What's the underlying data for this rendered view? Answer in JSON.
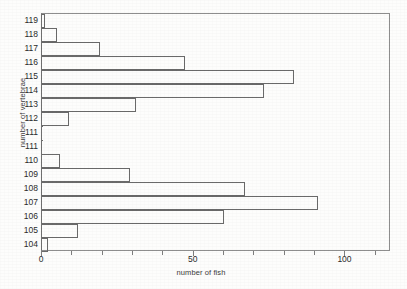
{
  "chart_data": {
    "type": "bar",
    "orientation": "horizontal",
    "title": "",
    "xlabel": "number of fish",
    "ylabel": "number of vertebrae",
    "categories": [
      "119",
      "118",
      "117",
      "116",
      "115",
      "114",
      "113",
      "112",
      "111",
      "111",
      "110",
      "109",
      "108",
      "107",
      "106",
      "105",
      "104"
    ],
    "values": [
      1,
      5,
      19,
      47,
      83,
      73,
      31,
      9,
      0,
      0,
      6,
      29,
      67,
      91,
      60,
      12,
      2
    ],
    "xlim": [
      0,
      115
    ],
    "ylim": [
      0,
      17
    ],
    "xticks": [
      0,
      10,
      20,
      30,
      40,
      50,
      60,
      70,
      80,
      90,
      100,
      110
    ],
    "xtick_labels": [
      "0",
      "",
      "",
      "",
      "",
      "50",
      "",
      "",
      "",
      "",
      "100",
      ""
    ],
    "grid": false,
    "legend": null,
    "bar_fill": "none",
    "bar_edge_color": "#6a6a6a",
    "axis_color": "#8e8e8e",
    "background": "#fdfdfc"
  },
  "axes": {
    "y_title": "number of vertebrae",
    "x_title": "number of fish"
  }
}
